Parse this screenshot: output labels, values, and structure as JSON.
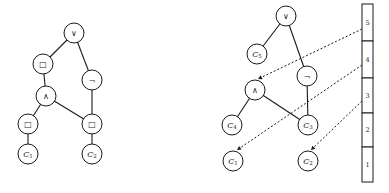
{
  "diagram": {
    "left_tree": {
      "nodes": [
        {
          "id": "or",
          "label": "∨",
          "x": 74,
          "y": 33
        },
        {
          "id": "box1",
          "label": "□",
          "x": 43,
          "y": 64
        },
        {
          "id": "not",
          "label": "¬",
          "x": 92,
          "y": 80
        },
        {
          "id": "and",
          "label": "∧",
          "x": 46,
          "y": 96
        },
        {
          "id": "box2",
          "label": "□",
          "x": 28,
          "y": 124
        },
        {
          "id": "box3",
          "label": "□",
          "x": 92,
          "y": 124
        },
        {
          "id": "c1",
          "label": "C",
          "sub": "1",
          "x": 28,
          "y": 154
        },
        {
          "id": "c2",
          "label": "C",
          "sub": "2",
          "x": 92,
          "y": 154
        }
      ],
      "edges": [
        [
          "or",
          "box1"
        ],
        [
          "or",
          "not"
        ],
        [
          "box1",
          "and"
        ],
        [
          "and",
          "box2"
        ],
        [
          "and",
          "box3"
        ],
        [
          "not",
          "box3"
        ],
        [
          "box2",
          "c1"
        ],
        [
          "box3",
          "c2"
        ]
      ]
    },
    "right_tree": {
      "nodes": [
        {
          "id": "or",
          "label": "∨",
          "x": 286,
          "y": 16
        },
        {
          "id": "c5",
          "label": "C",
          "sub": "5",
          "x": 257,
          "y": 54
        },
        {
          "id": "not",
          "label": "¬",
          "x": 307,
          "y": 76
        },
        {
          "id": "and",
          "label": "∧",
          "x": 255,
          "y": 90
        },
        {
          "id": "c4",
          "label": "C",
          "sub": "4",
          "x": 232,
          "y": 125
        },
        {
          "id": "c3",
          "label": "C",
          "sub": "3",
          "x": 308,
          "y": 125
        },
        {
          "id": "c1",
          "label": "C",
          "sub": "1",
          "x": 233,
          "y": 161
        },
        {
          "id": "c2",
          "label": "C",
          "sub": "2",
          "x": 308,
          "y": 161
        }
      ],
      "edges": [
        [
          "or",
          "c5"
        ],
        [
          "or",
          "not"
        ],
        [
          "not",
          "c3"
        ],
        [
          "and",
          "c4"
        ],
        [
          "and",
          "c3"
        ]
      ]
    },
    "stack": {
      "x": 362,
      "width": 11,
      "cells": [
        {
          "label": "5",
          "y0": 4,
          "y1": 41
        },
        {
          "label": "4",
          "y0": 41,
          "y1": 78
        },
        {
          "label": "3",
          "y0": 78,
          "y1": 113
        },
        {
          "label": "2",
          "y0": 113,
          "y1": 147
        },
        {
          "label": "1",
          "y0": 147,
          "y1": 182
        }
      ]
    },
    "pointers": [
      {
        "from_cell": "5",
        "x1": 362,
        "y1": 29,
        "x2": 258,
        "y2": 79
      },
      {
        "from_cell": "4",
        "x1": 362,
        "y1": 65,
        "x2": 237,
        "y2": 150
      },
      {
        "from_cell": "3",
        "x1": 362,
        "y1": 101,
        "x2": 311,
        "y2": 150
      }
    ],
    "node_radius": 10
  }
}
